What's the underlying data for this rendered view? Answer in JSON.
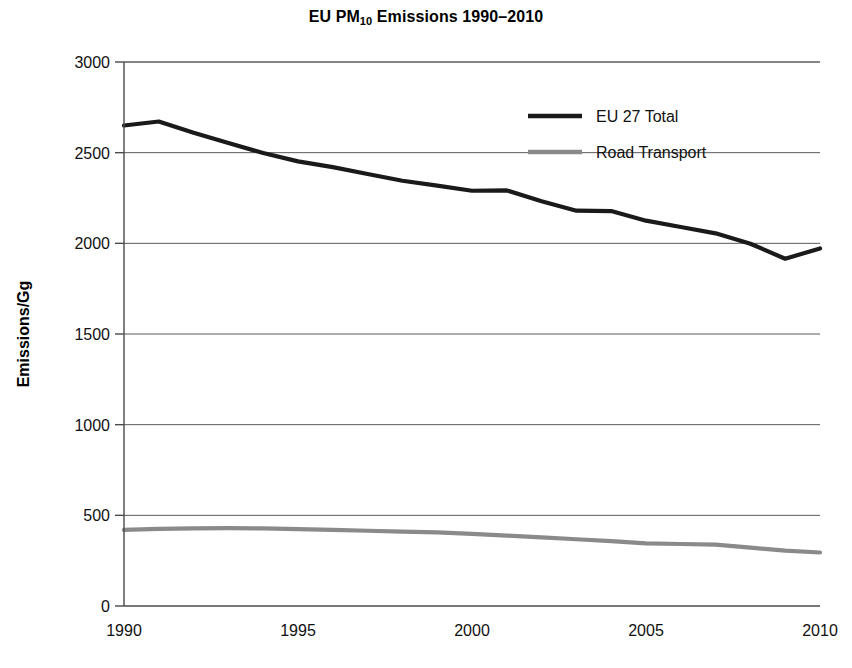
{
  "chart_data": {
    "type": "line",
    "title": "EU PM10 Emissions 1990–2010",
    "title_main": "EU PM",
    "title_sub": "10",
    "title_tail": " Emissions 1990–2010",
    "xlabel": "",
    "ylabel": "Emissions/Gg",
    "xlim": [
      1990,
      2010
    ],
    "ylim": [
      0,
      3000
    ],
    "grid": true,
    "legend_position": "top-right",
    "xticks": [
      1990,
      1995,
      2000,
      2005,
      2010
    ],
    "xtick_labels": [
      "1990",
      "1995",
      "2000",
      "2005",
      "2010"
    ],
    "yticks": [
      0,
      500,
      1000,
      1500,
      2000,
      2500,
      3000
    ],
    "ytick_labels": [
      "0",
      "500",
      "1000",
      "1500",
      "2000",
      "2500",
      "3000"
    ],
    "x": [
      1990,
      1991,
      1992,
      1993,
      1994,
      1995,
      1996,
      1997,
      1998,
      1999,
      2000,
      2001,
      2002,
      2003,
      2004,
      2005,
      2006,
      2007,
      2008,
      2009,
      2010
    ],
    "series": [
      {
        "name": "EU 27 Total",
        "color": "#1a1a1a",
        "width": 4.2,
        "values": [
          2650,
          2672,
          2610,
          2553,
          2498,
          2452,
          2420,
          2382,
          2345,
          2318,
          2290,
          2292,
          2232,
          2180,
          2178,
          2125,
          2090,
          2055,
          1998,
          1915,
          1972
        ]
      },
      {
        "name": "Road Transport",
        "color": "#8a8a8a",
        "width": 4.2,
        "values": [
          420,
          425,
          428,
          430,
          428,
          424,
          420,
          415,
          410,
          406,
          398,
          388,
          378,
          368,
          358,
          345,
          342,
          338,
          322,
          305,
          295
        ]
      }
    ]
  },
  "legend": {
    "entries": [
      {
        "label": "EU 27 Total",
        "color": "#1a1a1a"
      },
      {
        "label": "Road Transport",
        "color": "#8a8a8a"
      }
    ]
  },
  "axes": {
    "y_axis_title": "Emissions/Gg"
  }
}
